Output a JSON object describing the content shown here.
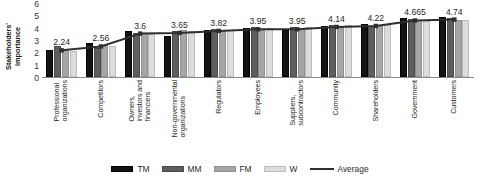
{
  "chart_data": {
    "type": "bar",
    "title": "",
    "xlabel": "",
    "ylabel": "Stakeholders'\nimportance",
    "ylim": [
      0,
      6
    ],
    "yticks": [
      6,
      5,
      4,
      3,
      2,
      1,
      0
    ],
    "grid": false,
    "legend_position": "bottom",
    "categories": [
      "Professional\norganizations",
      "Competitors",
      "Owners,\ninvestors and\nfinanciers",
      "Non-governmental\norganizations",
      "Regulators",
      "Employees",
      "Suppliers,\nsubcontractors",
      "Community",
      "Shareholders",
      "Government",
      "Customers"
    ],
    "series": [
      {
        "name": "TM",
        "color": "#131313",
        "values": [
          2.2,
          2.75,
          3.75,
          3.3,
          3.85,
          3.95,
          3.8,
          4.1,
          4.3,
          4.8,
          4.85
        ]
      },
      {
        "name": "MM",
        "color": "#5e5e5e",
        "values": [
          2.55,
          2.35,
          3.6,
          3.75,
          3.9,
          4.05,
          4.05,
          4.2,
          4.15,
          4.7,
          4.8
        ]
      },
      {
        "name": "FM",
        "color": "#a6a6a6",
        "values": [
          2.15,
          2.6,
          3.55,
          3.8,
          3.75,
          3.85,
          3.9,
          4.05,
          4.2,
          4.6,
          4.65
        ]
      },
      {
        "name": "W",
        "color": "#dcdcdc",
        "values": [
          2.1,
          2.55,
          3.5,
          3.75,
          3.8,
          3.95,
          4.05,
          4.2,
          4.25,
          4.55,
          4.6
        ]
      }
    ],
    "average_line": {
      "name": "Average",
      "color": "#2f2f2f",
      "values": [
        2.24,
        2.56,
        3.6,
        3.65,
        3.82,
        3.95,
        3.95,
        4.14,
        4.22,
        4.665,
        4.74
      ]
    },
    "data_labels": [
      "2.24",
      "2.56",
      "3.6",
      "3.65",
      "3.82",
      "3.95",
      "3.95",
      "4.14",
      "4.22",
      "4.665",
      "4.74"
    ]
  },
  "legend": {
    "items": [
      {
        "label": "TM",
        "key": "tm"
      },
      {
        "label": "MM",
        "key": "mm"
      },
      {
        "label": "FM",
        "key": "fm"
      },
      {
        "label": "W",
        "key": "w"
      },
      {
        "label": "Average",
        "key": "line"
      }
    ]
  }
}
